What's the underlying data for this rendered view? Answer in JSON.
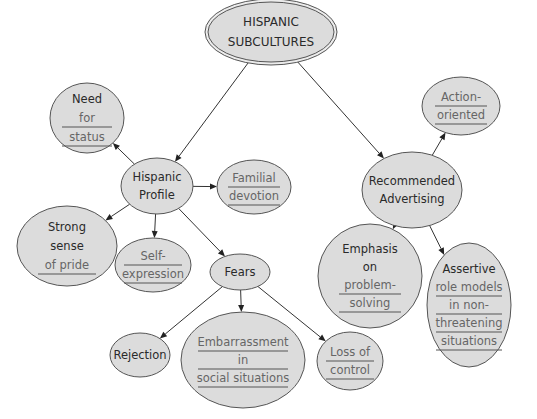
{
  "diagram": {
    "nodes": [
      {
        "id": "root",
        "lines": [
          "HISPANIC",
          "SUBCULTURES"
        ],
        "underlined": [
          false,
          false
        ],
        "style": "double"
      },
      {
        "id": "profile",
        "lines": [
          "Hispanic",
          "Profile"
        ],
        "underlined": [
          false,
          false
        ]
      },
      {
        "id": "status",
        "lines": [
          "Need",
          "for",
          "status"
        ],
        "underlined": [
          false,
          true,
          true
        ]
      },
      {
        "id": "familial",
        "lines": [
          "Familial",
          "devotion"
        ],
        "underlined": [
          true,
          true
        ]
      },
      {
        "id": "pride",
        "lines": [
          "Strong",
          "sense",
          "of pride"
        ],
        "underlined": [
          false,
          false,
          true
        ]
      },
      {
        "id": "selfexp",
        "lines": [
          "Self-",
          "expression"
        ],
        "underlined": [
          true,
          true
        ]
      },
      {
        "id": "fears",
        "lines": [
          "Fears"
        ],
        "underlined": [
          false
        ]
      },
      {
        "id": "rejection",
        "lines": [
          "Rejection"
        ],
        "underlined": [
          false
        ]
      },
      {
        "id": "embarrass",
        "lines": [
          "Embarrassment",
          "in",
          "social situations"
        ],
        "underlined": [
          true,
          true,
          true
        ]
      },
      {
        "id": "loss",
        "lines": [
          "Loss of",
          "control"
        ],
        "underlined": [
          true,
          true
        ]
      },
      {
        "id": "advert",
        "lines": [
          "Recommended",
          "Advertising"
        ],
        "underlined": [
          false,
          false
        ]
      },
      {
        "id": "action",
        "lines": [
          "Action-",
          "oriented"
        ],
        "underlined": [
          true,
          true
        ]
      },
      {
        "id": "emphasis",
        "lines": [
          "Emphasis",
          "on",
          "problem-",
          "solving"
        ],
        "underlined": [
          false,
          false,
          true,
          true
        ]
      },
      {
        "id": "assertive",
        "lines": [
          "Assertive",
          "role models",
          "in non-",
          "threatening",
          "situations"
        ],
        "underlined": [
          false,
          true,
          true,
          true,
          true
        ]
      }
    ],
    "edges": [
      {
        "from": "root",
        "to": "profile"
      },
      {
        "from": "root",
        "to": "advert"
      },
      {
        "from": "profile",
        "to": "status"
      },
      {
        "from": "profile",
        "to": "familial"
      },
      {
        "from": "profile",
        "to": "pride"
      },
      {
        "from": "profile",
        "to": "selfexp"
      },
      {
        "from": "profile",
        "to": "fears"
      },
      {
        "from": "fears",
        "to": "rejection"
      },
      {
        "from": "fears",
        "to": "embarrass"
      },
      {
        "from": "fears",
        "to": "loss"
      },
      {
        "from": "advert",
        "to": "action"
      },
      {
        "from": "advert",
        "to": "emphasis"
      },
      {
        "from": "advert",
        "to": "assertive"
      }
    ],
    "colors": {
      "node_fill": "#dcdcdc",
      "node_stroke": "#555555",
      "text": "#2a2a2a",
      "underlined_text": "#666666",
      "edge": "#333333"
    }
  }
}
